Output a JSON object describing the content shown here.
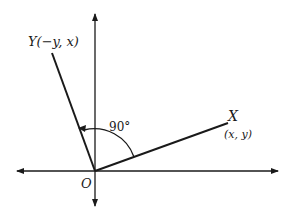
{
  "diagram": {
    "type": "rotation-by-90-degrees",
    "origin_label": "O",
    "point_x": {
      "name": "X",
      "coords": "(x, y)"
    },
    "point_y": {
      "name": "Y",
      "coords": "(−y, x)",
      "full_label": "Y(−y, x)"
    },
    "angle_label": "90°",
    "colors": {
      "ink": "#1a1a1a",
      "background": "#ffffff"
    }
  }
}
